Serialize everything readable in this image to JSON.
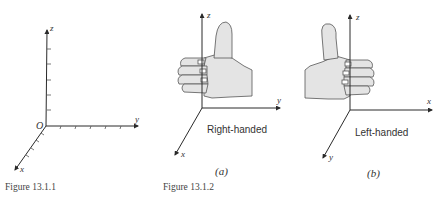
{
  "figure_1": {
    "caption": "Figure 13.1.1",
    "origin_label": "O",
    "axes": {
      "x": "x",
      "y": "y",
      "z": "z"
    }
  },
  "figure_2": {
    "caption": "Figure 13.1.2",
    "panel_a": {
      "label": "(a)",
      "description": "Right-handed",
      "axes": {
        "x": "x",
        "y": "y",
        "z": "z"
      }
    },
    "panel_b": {
      "label": "(b)",
      "description": "Left-handed",
      "axes": {
        "x": "x",
        "y": "y",
        "z": "z"
      }
    }
  },
  "colors": {
    "axis": "#2a2a2a",
    "hand_fill": "#e4e4e4",
    "hand_stroke": "#555555"
  }
}
